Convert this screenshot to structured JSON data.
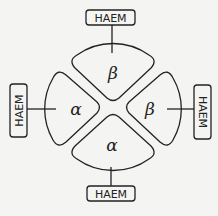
{
  "diagram": {
    "center": [
      113,
      107
    ],
    "subunits": [
      {
        "position": "top",
        "label": "β"
      },
      {
        "position": "right",
        "label": "β"
      },
      {
        "position": "bottom",
        "label": "α"
      },
      {
        "position": "left",
        "label": "α"
      }
    ],
    "haem_groups": [
      {
        "position": "top",
        "label": "HAEM"
      },
      {
        "position": "right",
        "label": "HAEM"
      },
      {
        "position": "bottom",
        "label": "HAEM"
      },
      {
        "position": "left",
        "label": "HAEM"
      }
    ],
    "colors": {
      "stroke": "#222222",
      "background": "#f4f4f2"
    }
  }
}
